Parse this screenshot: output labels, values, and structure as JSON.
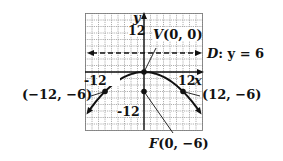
{
  "figure": {
    "type": "parabola-graph",
    "equation_hint": "x^2 = -24y",
    "axes": {
      "x_label": "x",
      "y_label": "y",
      "x_tick_labels": [
        "-12",
        "12"
      ],
      "y_tick_labels": [
        "12",
        "-12"
      ],
      "grid_step": 2,
      "x_range": [
        -18,
        18
      ],
      "y_range": [
        -18,
        18
      ]
    },
    "vertex": {
      "label": "V(0, 0)",
      "x": 0,
      "y": 0
    },
    "focus": {
      "label": "F(0, −6)",
      "x": 0,
      "y": -6
    },
    "directrix": {
      "label": "D: y = 6",
      "y": 6
    },
    "points": [
      {
        "label": "(−12, −6)",
        "x": -12,
        "y": -6
      },
      {
        "label": "(12, −6)",
        "x": 12,
        "y": -6
      }
    ],
    "colors": {
      "ink": "#111111",
      "grid": "#9a9a9a",
      "background": "#ffffff"
    }
  }
}
